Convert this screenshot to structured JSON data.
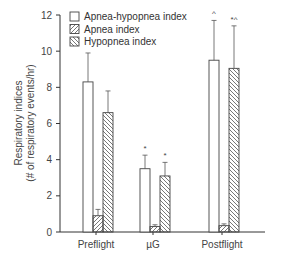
{
  "chart_data": {
    "type": "bar",
    "title": "",
    "xlabel": "",
    "ylabel": "Respiratory indices",
    "ylabel_sub": "(# of respiratory events/hr)",
    "ylim": [
      0,
      12
    ],
    "yticks": [
      "0",
      "2",
      "4",
      "6",
      "8",
      "10",
      "12"
    ],
    "categories": [
      "Preflight",
      "µG",
      "Postflight"
    ],
    "grid": false,
    "legend_position": "top-left inside",
    "series": [
      {
        "name": "Apnea-hypopnea index",
        "pattern": "open",
        "values": [
          8.3,
          3.5,
          9.5
        ],
        "error_upper": [
          9.9,
          4.25,
          11.7
        ],
        "marks": [
          "",
          "*",
          "^"
        ]
      },
      {
        "name": "Apnea index",
        "pattern": "hatch-forward",
        "values": [
          0.9,
          0.3,
          0.35
        ],
        "error_upper": [
          1.25,
          0.4,
          0.45
        ],
        "marks": [
          "",
          "",
          ""
        ]
      },
      {
        "name": "Hypopnea index",
        "pattern": "hatch-back",
        "values": [
          6.6,
          3.1,
          9.05
        ],
        "error_upper": [
          7.8,
          3.85,
          11.4
        ],
        "marks": [
          "",
          "*",
          "*^"
        ]
      }
    ]
  },
  "legend": {
    "items": [
      "Apnea-hypopnea index",
      "Apnea index",
      "Hypopnea index"
    ]
  },
  "axis": {
    "y_title": "Respiratory indices",
    "y_subtitle": "(# of respiratory events/hr)"
  }
}
